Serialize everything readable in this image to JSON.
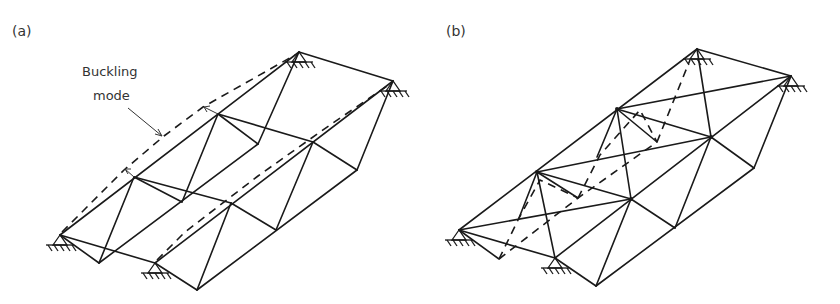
{
  "panels": [
    {
      "id": "a",
      "label": "(a)",
      "annotation": {
        "line1": "Buckling",
        "line2": "mode"
      },
      "description": "Space truss (two-panel pyramid grid) with buckling mode shown dashed, pinned supports at four corners"
    },
    {
      "id": "b",
      "label": "(b)",
      "description": "Same space truss with additional diagonal bracing members, buckling mode dashed, pinned supports at four corners"
    }
  ],
  "colors": {
    "line": "#1a1a1a",
    "text": "#333333",
    "background": "#ffffff"
  }
}
